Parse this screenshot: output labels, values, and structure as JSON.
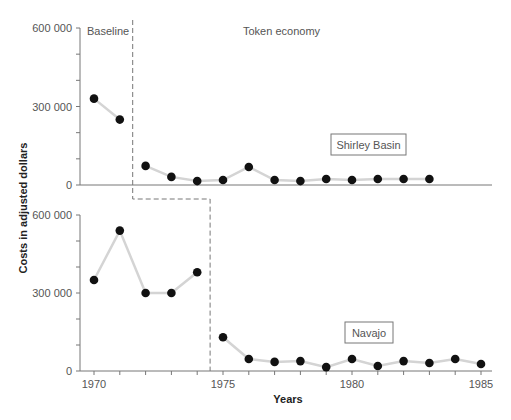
{
  "chart_data": {
    "type": "line",
    "title": "",
    "xlabel": "Years",
    "ylabel": "Costs in adjusted dollars",
    "x_ticks": [
      "1970",
      "1975",
      "1980",
      "1985"
    ],
    "y_ticks": [
      "0",
      "300 000",
      "600 000"
    ],
    "ylim": [
      0,
      600000
    ],
    "xlim": [
      1970,
      1985
    ],
    "grid": false,
    "phase_labels": {
      "baseline": "Baseline",
      "treatment": "Token economy"
    },
    "panels": [
      {
        "name": "Shirley Basin",
        "baseline_end": 1971.5,
        "x": [
          1970,
          1971,
          1972,
          1973,
          1974,
          1975,
          1976,
          1977,
          1978,
          1979,
          1980,
          1981,
          1982,
          1983
        ],
        "values": [
          330000,
          250000,
          73000,
          31000,
          15000,
          19000,
          69000,
          19000,
          15000,
          23000,
          19000,
          23000,
          23000,
          23000
        ]
      },
      {
        "name": "Navajo",
        "baseline_end": 1974.5,
        "x": [
          1970,
          1971,
          1972,
          1973,
          1974,
          1975,
          1976,
          1977,
          1978,
          1979,
          1980,
          1981,
          1982,
          1983,
          1984,
          1985
        ],
        "values": [
          350000,
          540000,
          300000,
          300000,
          380000,
          130000,
          46000,
          35000,
          38000,
          15000,
          46000,
          19000,
          38000,
          31000,
          46000,
          27000
        ]
      }
    ]
  }
}
